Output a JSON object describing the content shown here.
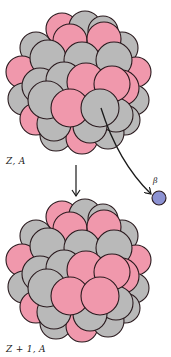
{
  "diagram": {
    "colors": {
      "proton": "#f098ac",
      "neutron": "#b9b9b9",
      "outline": "#2a1a1e",
      "beta": "#8c92d2",
      "arrow": "#1a1a1a",
      "background": "#ffffff"
    },
    "parent_nucleus": {
      "label": "Z, A",
      "spheres": [
        {
          "x": 62,
          "y": 29,
          "r": 16,
          "type": "proton"
        },
        {
          "x": 85,
          "y": 27,
          "r": 16,
          "type": "neutron"
        },
        {
          "x": 103,
          "y": 31,
          "r": 15,
          "type": "neutron"
        },
        {
          "x": 36,
          "y": 48,
          "r": 16,
          "type": "neutron"
        },
        {
          "x": 122,
          "y": 48,
          "r": 16,
          "type": "neutron"
        },
        {
          "x": 22,
          "y": 72,
          "r": 16,
          "type": "proton"
        },
        {
          "x": 136,
          "y": 72,
          "r": 15,
          "type": "proton"
        },
        {
          "x": 24,
          "y": 99,
          "r": 16,
          "type": "neutron"
        },
        {
          "x": 134,
          "y": 100,
          "r": 15,
          "type": "neutron"
        },
        {
          "x": 36,
          "y": 119,
          "r": 16,
          "type": "proton"
        },
        {
          "x": 125,
          "y": 120,
          "r": 15,
          "type": "neutron"
        },
        {
          "x": 56,
          "y": 135,
          "r": 16,
          "type": "neutron"
        },
        {
          "x": 82,
          "y": 138,
          "r": 16,
          "type": "proton"
        },
        {
          "x": 108,
          "y": 133,
          "r": 16,
          "type": "neutron"
        },
        {
          "x": 70,
          "y": 41,
          "r": 17,
          "type": "proton"
        },
        {
          "x": 104,
          "y": 39,
          "r": 17,
          "type": "proton"
        },
        {
          "x": 48,
          "y": 58,
          "r": 18,
          "type": "neutron"
        },
        {
          "x": 82,
          "y": 60,
          "r": 18,
          "type": "neutron"
        },
        {
          "x": 114,
          "y": 60,
          "r": 18,
          "type": "neutron"
        },
        {
          "x": 40,
          "y": 86,
          "r": 18,
          "type": "neutron"
        },
        {
          "x": 64,
          "y": 80,
          "r": 18,
          "type": "neutron"
        },
        {
          "x": 121,
          "y": 88,
          "r": 18,
          "type": "proton"
        },
        {
          "x": 54,
          "y": 124,
          "r": 17,
          "type": "neutron"
        },
        {
          "x": 116,
          "y": 115,
          "r": 17,
          "type": "neutron"
        },
        {
          "x": 90,
          "y": 126,
          "r": 17,
          "type": "neutron"
        },
        {
          "x": 86,
          "y": 82,
          "r": 19,
          "type": "proton"
        },
        {
          "x": 112,
          "y": 84,
          "r": 18,
          "type": "proton"
        },
        {
          "x": 47,
          "y": 100,
          "r": 19,
          "type": "neutron"
        },
        {
          "x": 70,
          "y": 108,
          "r": 19,
          "type": "proton"
        },
        {
          "x": 100,
          "y": 108,
          "r": 19,
          "type": "neutron"
        }
      ],
      "emitting_sphere_index": 29
    },
    "decay_arrow": {
      "x": 76,
      "y1": 165,
      "y2": 196
    },
    "emission_path": {
      "start": {
        "x": 101,
        "y": 108
      },
      "control": {
        "x": 118,
        "y": 162
      },
      "end": {
        "x": 151,
        "y": 194
      }
    },
    "beta_particle": {
      "label": "β",
      "x": 159,
      "y": 198,
      "r": 7
    },
    "daughter_nucleus": {
      "label": "Z + 1, A",
      "spheres": [
        {
          "x": 62,
          "y": 217,
          "r": 16,
          "type": "proton"
        },
        {
          "x": 85,
          "y": 215,
          "r": 16,
          "type": "neutron"
        },
        {
          "x": 103,
          "y": 219,
          "r": 15,
          "type": "neutron"
        },
        {
          "x": 36,
          "y": 236,
          "r": 16,
          "type": "neutron"
        },
        {
          "x": 122,
          "y": 236,
          "r": 16,
          "type": "neutron"
        },
        {
          "x": 22,
          "y": 260,
          "r": 16,
          "type": "proton"
        },
        {
          "x": 136,
          "y": 260,
          "r": 15,
          "type": "proton"
        },
        {
          "x": 24,
          "y": 287,
          "r": 16,
          "type": "neutron"
        },
        {
          "x": 134,
          "y": 288,
          "r": 15,
          "type": "neutron"
        },
        {
          "x": 36,
          "y": 307,
          "r": 16,
          "type": "proton"
        },
        {
          "x": 125,
          "y": 308,
          "r": 15,
          "type": "neutron"
        },
        {
          "x": 56,
          "y": 323,
          "r": 16,
          "type": "neutron"
        },
        {
          "x": 82,
          "y": 326,
          "r": 16,
          "type": "proton"
        },
        {
          "x": 108,
          "y": 321,
          "r": 16,
          "type": "neutron"
        },
        {
          "x": 70,
          "y": 229,
          "r": 17,
          "type": "proton"
        },
        {
          "x": 104,
          "y": 227,
          "r": 17,
          "type": "proton"
        },
        {
          "x": 48,
          "y": 246,
          "r": 18,
          "type": "neutron"
        },
        {
          "x": 82,
          "y": 248,
          "r": 18,
          "type": "neutron"
        },
        {
          "x": 114,
          "y": 248,
          "r": 18,
          "type": "neutron"
        },
        {
          "x": 40,
          "y": 274,
          "r": 18,
          "type": "neutron"
        },
        {
          "x": 64,
          "y": 268,
          "r": 18,
          "type": "neutron"
        },
        {
          "x": 121,
          "y": 276,
          "r": 18,
          "type": "proton"
        },
        {
          "x": 54,
          "y": 312,
          "r": 17,
          "type": "neutron"
        },
        {
          "x": 116,
          "y": 303,
          "r": 17,
          "type": "neutron"
        },
        {
          "x": 90,
          "y": 314,
          "r": 17,
          "type": "neutron"
        },
        {
          "x": 86,
          "y": 270,
          "r": 19,
          "type": "proton"
        },
        {
          "x": 112,
          "y": 272,
          "r": 18,
          "type": "proton"
        },
        {
          "x": 47,
          "y": 288,
          "r": 19,
          "type": "neutron"
        },
        {
          "x": 70,
          "y": 296,
          "r": 19,
          "type": "proton"
        },
        {
          "x": 100,
          "y": 296,
          "r": 19,
          "type": "proton"
        }
      ]
    }
  }
}
